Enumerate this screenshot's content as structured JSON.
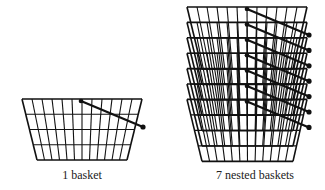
{
  "figures": [
    {
      "id": "single",
      "caption": "1 basket",
      "basket_count": 1,
      "grid_columns": 12,
      "grid_rows": 4
    },
    {
      "id": "nested",
      "caption": "7 nested baskets",
      "basket_count": 7,
      "grid_columns": 12,
      "grid_rows": 4
    }
  ],
  "colors": {
    "stroke": "#111111",
    "background": "#ffffff"
  }
}
